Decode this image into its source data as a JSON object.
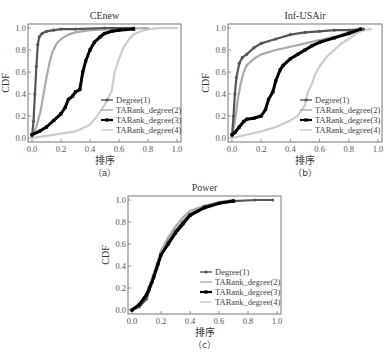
{
  "chart_data": [
    {
      "type": "line",
      "panel": "a",
      "title": "CEnew",
      "caption": "（a）",
      "xlabel": "排序",
      "ylabel": "CDF",
      "xlim": [
        0,
        1
      ],
      "ylim": [
        0,
        1
      ],
      "xticks": [
        "0.0",
        "0.2",
        "0.4",
        "0.6",
        "0.8",
        "1.0"
      ],
      "yticks": [
        "0.0",
        "0.2",
        "0.4",
        "0.6",
        "0.8",
        "1.0"
      ],
      "grid": false,
      "legend_position": "lower right",
      "series": [
        {
          "name": "Degree(1)",
          "color": "#555555",
          "x": [
            0,
            0.01,
            0.02,
            0.03,
            0.04,
            0.05,
            0.07,
            0.1,
            0.15,
            0.2,
            0.3,
            0.5,
            0.7
          ],
          "y": [
            0.02,
            0.15,
            0.4,
            0.65,
            0.85,
            0.92,
            0.95,
            0.97,
            0.98,
            0.99,
            0.99,
            1.0,
            1.0
          ]
        },
        {
          "name": "TARank_degree(2)",
          "color": "#aaaaaa",
          "x": [
            0,
            0.03,
            0.06,
            0.08,
            0.1,
            0.12,
            0.14,
            0.17,
            0.2,
            0.25,
            0.3,
            0.4,
            0.55,
            0.8
          ],
          "y": [
            0.02,
            0.1,
            0.25,
            0.4,
            0.55,
            0.68,
            0.78,
            0.86,
            0.9,
            0.94,
            0.96,
            0.98,
            0.99,
            1.0
          ]
        },
        {
          "name": "TARank_degree(3)",
          "color": "#000000",
          "x": [
            0,
            0.05,
            0.1,
            0.15,
            0.2,
            0.23,
            0.25,
            0.28,
            0.3,
            0.33,
            0.35,
            0.37,
            0.4,
            0.43,
            0.47,
            0.5,
            0.55,
            0.6,
            0.7
          ],
          "y": [
            0.03,
            0.06,
            0.1,
            0.16,
            0.22,
            0.28,
            0.35,
            0.38,
            0.42,
            0.44,
            0.6,
            0.7,
            0.8,
            0.87,
            0.92,
            0.95,
            0.97,
            0.98,
            0.99
          ]
        },
        {
          "name": "TARank_degree(4)",
          "color": "#cccccc",
          "x": [
            0,
            0.1,
            0.2,
            0.3,
            0.4,
            0.45,
            0.5,
            0.55,
            0.57,
            0.6,
            0.63,
            0.67,
            0.7,
            0.75,
            0.8,
            0.9,
            1.0
          ],
          "y": [
            0.0,
            0.02,
            0.04,
            0.06,
            0.12,
            0.2,
            0.3,
            0.43,
            0.6,
            0.72,
            0.82,
            0.9,
            0.94,
            0.97,
            0.99,
            1.0,
            1.0
          ]
        }
      ]
    },
    {
      "type": "line",
      "panel": "b",
      "title": "Inf-USAir",
      "caption": "（b）",
      "xlabel": "排序",
      "ylabel": "CDF",
      "xlim": [
        0,
        1
      ],
      "ylim": [
        0,
        1
      ],
      "xticks": [
        "0.0",
        "0.2",
        "0.4",
        "0.6",
        "0.8",
        "1.0"
      ],
      "yticks": [
        "0.0",
        "0.2",
        "0.4",
        "0.6",
        "0.8",
        "1.0"
      ],
      "grid": false,
      "legend_position": "lower right",
      "series": [
        {
          "name": "Degree(1)",
          "color": "#555555",
          "x": [
            0,
            0.01,
            0.02,
            0.03,
            0.05,
            0.07,
            0.1,
            0.15,
            0.2,
            0.3,
            0.4,
            0.5,
            0.6,
            0.7,
            0.8,
            0.9
          ],
          "y": [
            0.02,
            0.2,
            0.4,
            0.55,
            0.68,
            0.73,
            0.76,
            0.82,
            0.86,
            0.9,
            0.94,
            0.96,
            0.97,
            0.98,
            0.98,
            0.99
          ]
        },
        {
          "name": "TARank_degree(2)",
          "color": "#aaaaaa",
          "x": [
            0,
            0.02,
            0.04,
            0.06,
            0.08,
            0.1,
            0.15,
            0.2,
            0.3,
            0.4,
            0.5,
            0.6,
            0.7,
            0.8,
            0.9
          ],
          "y": [
            0.02,
            0.15,
            0.35,
            0.5,
            0.6,
            0.66,
            0.72,
            0.76,
            0.8,
            0.83,
            0.86,
            0.89,
            0.92,
            0.96,
            0.99
          ]
        },
        {
          "name": "TARank_degree(3)",
          "color": "#000000",
          "x": [
            0,
            0.02,
            0.05,
            0.08,
            0.1,
            0.15,
            0.2,
            0.23,
            0.25,
            0.28,
            0.3,
            0.33,
            0.35,
            0.4,
            0.45,
            0.5,
            0.55,
            0.6,
            0.7,
            0.8,
            0.88
          ],
          "y": [
            0.03,
            0.05,
            0.1,
            0.15,
            0.17,
            0.18,
            0.2,
            0.26,
            0.35,
            0.42,
            0.52,
            0.62,
            0.66,
            0.72,
            0.76,
            0.8,
            0.84,
            0.87,
            0.91,
            0.95,
            0.99
          ]
        },
        {
          "name": "TARank_degree(4)",
          "color": "#cccccc",
          "x": [
            0,
            0.1,
            0.2,
            0.3,
            0.4,
            0.45,
            0.5,
            0.52,
            0.55,
            0.57,
            0.6,
            0.65,
            0.7,
            0.75,
            0.8,
            0.85,
            0.9,
            0.95
          ],
          "y": [
            0.0,
            0.03,
            0.06,
            0.1,
            0.16,
            0.2,
            0.3,
            0.42,
            0.5,
            0.58,
            0.65,
            0.74,
            0.8,
            0.86,
            0.9,
            0.95,
            0.98,
            0.99
          ]
        }
      ]
    },
    {
      "type": "line",
      "panel": "c",
      "title": "Power",
      "caption": "（c）",
      "xlabel": "排序",
      "ylabel": "CDF",
      "xlim": [
        0,
        1
      ],
      "ylim": [
        0,
        1
      ],
      "xticks": [
        "0.0",
        "0.2",
        "0.4",
        "0.6",
        "0.8",
        "1.0"
      ],
      "yticks": [
        "0.0",
        "0.2",
        "0.4",
        "0.6",
        "0.8",
        "1.0"
      ],
      "grid": false,
      "legend_position": "lower right",
      "series": [
        {
          "name": "Degree(1)",
          "color": "#555555",
          "x": [
            0,
            0.05,
            0.1,
            0.12,
            0.14,
            0.17,
            0.2,
            0.25,
            0.3,
            0.35,
            0.4,
            0.5,
            0.6,
            0.7,
            0.85,
            0.97
          ],
          "y": [
            0.0,
            0.03,
            0.1,
            0.18,
            0.25,
            0.38,
            0.5,
            0.62,
            0.72,
            0.8,
            0.87,
            0.94,
            0.97,
            0.99,
            1.0,
            1.0
          ]
        },
        {
          "name": "TARank_degree(2)",
          "color": "#aaaaaa",
          "x": [
            0,
            0.05,
            0.1,
            0.12,
            0.15,
            0.18,
            0.2,
            0.25,
            0.3,
            0.35,
            0.4,
            0.5,
            0.6,
            0.7
          ],
          "y": [
            0.0,
            0.04,
            0.13,
            0.22,
            0.34,
            0.45,
            0.54,
            0.66,
            0.76,
            0.84,
            0.9,
            0.95,
            0.98,
            1.0
          ]
        },
        {
          "name": "TARank_degree(3)",
          "color": "#000000",
          "x": [
            0,
            0.05,
            0.1,
            0.12,
            0.15,
            0.18,
            0.2,
            0.25,
            0.3,
            0.35,
            0.4,
            0.5,
            0.6,
            0.7
          ],
          "y": [
            0.0,
            0.05,
            0.14,
            0.2,
            0.3,
            0.42,
            0.5,
            0.6,
            0.7,
            0.78,
            0.86,
            0.93,
            0.97,
            0.99
          ]
        },
        {
          "name": "TARank_degree(4)",
          "color": "#cccccc",
          "x": [
            0,
            0.05,
            0.1,
            0.12,
            0.15,
            0.18,
            0.2,
            0.25,
            0.3,
            0.35,
            0.4,
            0.5,
            0.6,
            0.7
          ],
          "y": [
            0.0,
            0.03,
            0.11,
            0.19,
            0.31,
            0.42,
            0.5,
            0.62,
            0.72,
            0.8,
            0.87,
            0.94,
            0.98,
            1.0
          ]
        }
      ]
    }
  ],
  "panels": [
    {
      "id": "a",
      "frame": {
        "x0": 28,
        "y0": 24,
        "x1": 181,
        "y1": 142
      },
      "legend": {
        "x": 101,
        "y": 100
      }
    },
    {
      "id": "b",
      "frame": {
        "x0": 228,
        "y0": 24,
        "x1": 382,
        "y1": 142
      },
      "legend": {
        "x": 300,
        "y": 100
      }
    },
    {
      "id": "c",
      "frame": {
        "x0": 128,
        "y0": 196,
        "x1": 281,
        "y1": 314
      },
      "legend": {
        "x": 200,
        "y": 272
      }
    }
  ],
  "styles": {
    "markers": [
      "circle",
      "none",
      "square",
      "none"
    ],
    "line_widths": [
      2.2,
      2.2,
      3,
      2.2
    ]
  }
}
